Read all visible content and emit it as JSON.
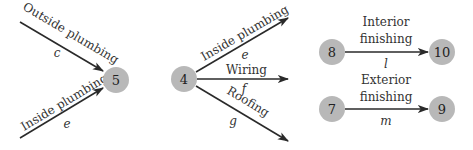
{
  "diagram": {
    "groups": [
      {
        "name": "merge-into-5",
        "target_node": "5",
        "edges": [
          {
            "label": "Outside plumbing",
            "variable": "c"
          },
          {
            "label": "Inside plumbing",
            "variable": "e"
          }
        ]
      },
      {
        "name": "split-from-4",
        "source_node": "4",
        "edges": [
          {
            "label": "Inside plumbing",
            "variable": "e"
          },
          {
            "label": "Wiring",
            "variable": "f"
          },
          {
            "label": "Roofing",
            "variable": "g"
          }
        ]
      },
      {
        "name": "interior",
        "source_node": "8",
        "target_node": "10",
        "edge": {
          "label_line1": "Interior",
          "label_line2": "finishing",
          "variable": "l"
        }
      },
      {
        "name": "exterior",
        "source_node": "7",
        "target_node": "9",
        "edge": {
          "label_line1": "Exterior",
          "label_line2": "finishing",
          "variable": "m"
        }
      }
    ]
  }
}
